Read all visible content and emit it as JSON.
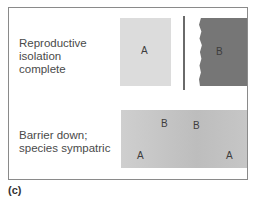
{
  "figure": {
    "label": "(c)",
    "rows": [
      {
        "caption": "Reproductive\nisolation\ncomplete",
        "regions": [
          {
            "species": "A",
            "shade": "#dcdcdc"
          },
          {
            "species": "B",
            "shade": "#767676"
          }
        ],
        "barrier": "present"
      },
      {
        "caption": "Barrier down;\nspecies sympatric",
        "regions": [
          {
            "species": "B"
          },
          {
            "species": "B"
          },
          {
            "species": "A"
          },
          {
            "species": "A"
          }
        ],
        "barrier": "absent"
      }
    ]
  }
}
